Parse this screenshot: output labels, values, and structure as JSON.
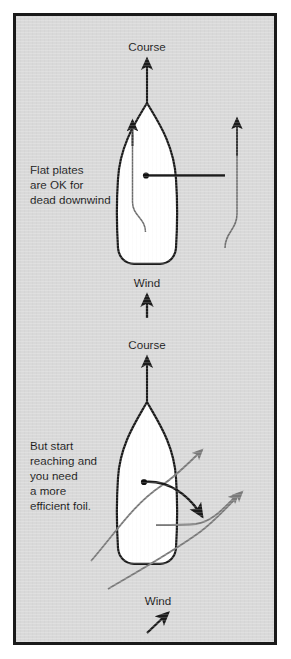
{
  "figure": {
    "background_color": "#d9d9d9",
    "border_color": "#1a1a1a",
    "hull_fill": "#ffffff",
    "ink_color": "#1b1b1b",
    "flow_line_color": "#7a7a7a"
  },
  "panels": [
    {
      "id": "top-panel",
      "course_label": "Course",
      "wind_label": "Wind",
      "caption_lines": [
        "Flat plates",
        "are OK for",
        "dead downwind"
      ],
      "foil_type": "flat plate",
      "wind_direction": "dead downwind"
    },
    {
      "id": "bottom-panel",
      "course_label": "Course",
      "wind_label": "Wind",
      "caption_lines": [
        "But start",
        "reaching and",
        "you need",
        "a more",
        "efficient foil."
      ],
      "foil_type": "cambered efficient foil",
      "wind_direction": "reaching (from lower left)"
    }
  ]
}
